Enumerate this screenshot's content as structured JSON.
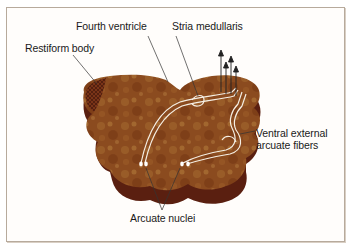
{
  "figure": {
    "labels": {
      "fourth_ventricle": "Fourth ventricle",
      "stria_medullaris": "Stria medullaris",
      "restiform_body": "Restiform body",
      "ventral_external_line1": "Ventral external",
      "ventral_external_line2": "arcuate fibers",
      "arcuate_nuclei": "Arcuate nuclei"
    },
    "colors": {
      "tissue_top": "#8a4a1e",
      "tissue_side": "#5a1f10",
      "tissue_highlight": "#b07a3a",
      "fiber": "#f5efe4",
      "frame_border": "#b7aa9c",
      "leader_line": "#333333",
      "arrow": "#222222"
    },
    "arrows_count": 4
  }
}
